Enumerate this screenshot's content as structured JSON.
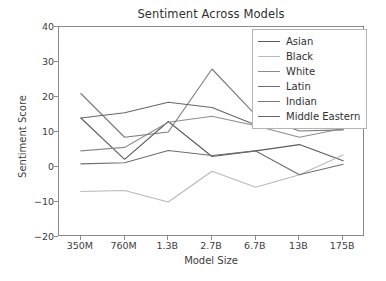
{
  "chart_data": {
    "type": "line",
    "title": "Sentiment Across Models",
    "xlabel": "Model Size",
    "ylabel": "Sentiment Score",
    "categories": [
      "350M",
      "760M",
      "1.3B",
      "2.7B",
      "6.7B",
      "13B",
      "175B"
    ],
    "ylim": [
      -20,
      40
    ],
    "yticks": [
      40,
      30,
      20,
      10,
      0,
      -10,
      -20
    ],
    "ytick_labels": [
      "40",
      "30",
      "20",
      "10",
      "0",
      "−10",
      "−20"
    ],
    "grid": false,
    "legend_position": "upper right",
    "series": [
      {
        "name": "Asian",
        "color": "#5b5b5b",
        "values": [
          14.0,
          2.2,
          13.0,
          3.0,
          4.6,
          6.4,
          1.8
        ]
      },
      {
        "name": "Black",
        "color": "#b9b9b9",
        "values": [
          -7.0,
          -6.7,
          -10.0,
          -1.2,
          -5.8,
          -2.2,
          3.4
        ]
      },
      {
        "name": "White",
        "color": "#8d8d8d",
        "values": [
          4.6,
          5.6,
          12.8,
          14.5,
          11.8,
          8.5,
          11.0
        ]
      },
      {
        "name": "Latin",
        "color": "#6e6e6e",
        "values": [
          0.9,
          1.2,
          4.7,
          3.3,
          4.6,
          -2.2,
          0.8
        ]
      },
      {
        "name": "Indian",
        "color": "#7a7a7a",
        "values": [
          21.0,
          8.5,
          10.0,
          28.0,
          14.8,
          10.3,
          10.6
        ]
      },
      {
        "name": "Middle Eastern",
        "color": "#666666",
        "values": [
          14.0,
          15.5,
          18.5,
          17.0,
          12.0,
          13.8,
          10.8
        ]
      }
    ]
  }
}
